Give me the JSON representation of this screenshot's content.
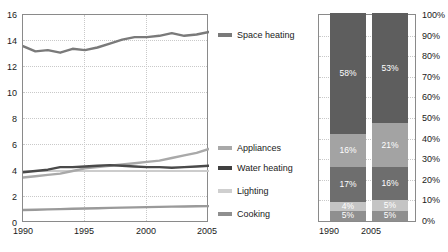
{
  "chart_data": [
    {
      "type": "line",
      "title": "",
      "xlabel": "",
      "ylabel": "",
      "xlim": [
        1990,
        2005
      ],
      "ylim": [
        0,
        16
      ],
      "ytick_labels": [
        "16",
        "14",
        "12",
        "10",
        "8",
        "6",
        "4",
        "2",
        "0"
      ],
      "ytick_values": [
        16,
        14,
        12,
        10,
        8,
        6,
        4,
        2,
        0
      ],
      "xtick_labels": [
        "1990",
        "1995",
        "2000",
        "2005"
      ],
      "xtick_values": [
        1990,
        1995,
        2000,
        2005
      ],
      "grid": true,
      "legend_position": "right",
      "x": [
        1990,
        1991,
        1992,
        1993,
        1994,
        1995,
        1996,
        1997,
        1998,
        1999,
        2000,
        2001,
        2002,
        2003,
        2004,
        2005
      ],
      "series": [
        {
          "name": "Space heating",
          "color": "#7a7a7a",
          "values": [
            13.6,
            13.2,
            13.3,
            13.1,
            13.4,
            13.3,
            13.5,
            13.8,
            14.1,
            14.3,
            14.3,
            14.4,
            14.6,
            14.4,
            14.5,
            14.7
          ]
        },
        {
          "name": "Appliances",
          "color": "#a9a9a9",
          "values": [
            3.5,
            3.6,
            3.7,
            3.8,
            4.0,
            4.2,
            4.3,
            4.4,
            4.5,
            4.6,
            4.7,
            4.8,
            5.0,
            5.2,
            5.4,
            5.7
          ]
        },
        {
          "name": "Water heating",
          "color": "#4a4a4a",
          "values": [
            3.9,
            4.0,
            4.1,
            4.3,
            4.3,
            4.35,
            4.4,
            4.45,
            4.4,
            4.35,
            4.3,
            4.3,
            4.25,
            4.3,
            4.35,
            4.4
          ]
        },
        {
          "name": "Lighting",
          "color": "#cccccc",
          "values": [
            4.0,
            4.0,
            4.0,
            4.0,
            4.0,
            4.0,
            4.0,
            4.0,
            4.0,
            4.0,
            4.0,
            4.0,
            4.0,
            4.0,
            4.0,
            4.0
          ]
        },
        {
          "name": "Cooking",
          "color": "#9a9a9a",
          "values": [
            1.0,
            1.02,
            1.05,
            1.07,
            1.1,
            1.12,
            1.14,
            1.16,
            1.18,
            1.2,
            1.22,
            1.24,
            1.26,
            1.27,
            1.29,
            1.3
          ]
        }
      ]
    },
    {
      "type": "bar",
      "subtype": "stacked-100",
      "title": "",
      "xlabel": "",
      "ylabel": "",
      "ylim": [
        0,
        100
      ],
      "grid": true,
      "categories": [
        "1990",
        "2005"
      ],
      "ytick_labels": [
        "100%",
        "90%",
        "80%",
        "70%",
        "60%",
        "50%",
        "40%",
        "30%",
        "20%",
        "10%",
        "0%"
      ],
      "ytick_values": [
        100,
        90,
        80,
        70,
        60,
        50,
        40,
        30,
        20,
        10,
        0
      ],
      "series": [
        {
          "name": "Space heating",
          "color": "#5e5e5e",
          "values": [
            58,
            53
          ],
          "labels": [
            "58%",
            "53%"
          ]
        },
        {
          "name": "Appliances",
          "color": "#a3a3a3",
          "values": [
            16,
            21
          ],
          "labels": [
            "16%",
            "21%"
          ]
        },
        {
          "name": "Water heating",
          "color": "#6e6e6e",
          "values": [
            17,
            16
          ],
          "labels": [
            "17%",
            "16%"
          ]
        },
        {
          "name": "Lighting",
          "color": "#c4c4c4",
          "values": [
            4,
            5
          ],
          "labels": [
            "4%",
            "5%"
          ]
        },
        {
          "name": "Cooking",
          "color": "#8f8f8f",
          "values": [
            5,
            5
          ],
          "labels": [
            "5%",
            "5%"
          ]
        }
      ]
    }
  ],
  "line_chart": {
    "ytick_labels": [
      "16",
      "14",
      "12",
      "10",
      "8",
      "6",
      "4",
      "2",
      "0"
    ],
    "xtick_labels": [
      "1990",
      "1995",
      "2000",
      "2005"
    ]
  },
  "legend": {
    "items": [
      {
        "label": "Space heating",
        "color": "#7a7a7a"
      },
      {
        "label": "Appliances",
        "color": "#a9a9a9"
      },
      {
        "label": "Water heating",
        "color": "#3f3f3f"
      },
      {
        "label": "Lighting",
        "color": "#cfcfcf"
      },
      {
        "label": "Cooking",
        "color": "#8f8f8f"
      }
    ]
  },
  "bar_chart": {
    "ytick_labels": [
      "100%",
      "90%",
      "80%",
      "70%",
      "60%",
      "50%",
      "40%",
      "30%",
      "20%",
      "10%",
      "0%"
    ],
    "xtick_labels": [
      "1990",
      "2005"
    ],
    "col1990": {
      "space_heating": "58%",
      "appliances": "16%",
      "water_heating": "17%",
      "lighting": "4%",
      "cooking": "5%"
    },
    "col2005": {
      "space_heating": "53%",
      "appliances": "21%",
      "water_heating": "16%",
      "lighting": "5%",
      "cooking": "5%"
    }
  }
}
